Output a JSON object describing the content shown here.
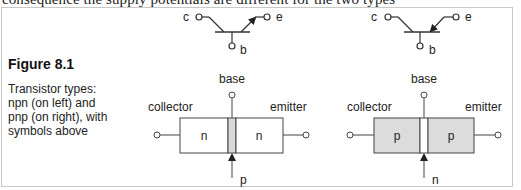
{
  "cutoff_text": "consequence the supply potentials are different for the two types",
  "figure": {
    "title": "Figure 8.1",
    "caption": "Transistor types: npn (on left) and pnp (on right), with symbols above"
  },
  "npn": {
    "symbol": {
      "collector_label": "c",
      "emitter_label": "e",
      "base_label": "b",
      "arrow_direction": "outward"
    },
    "block": {
      "base_label": "base",
      "collector_label": "collector",
      "emitter_label": "emitter",
      "left_region": "n",
      "right_region": "n",
      "middle_region": "p",
      "fill_color": "#ffffff",
      "strip_color": "#d9d9d9"
    }
  },
  "pnp": {
    "symbol": {
      "collector_label": "c",
      "emitter_label": "e",
      "base_label": "b",
      "arrow_direction": "inward"
    },
    "block": {
      "base_label": "base",
      "collector_label": "collector",
      "emitter_label": "emitter",
      "left_region": "p",
      "right_region": "p",
      "middle_region": "n",
      "fill_color": "#dcdcdc",
      "strip_color": "#ffffff"
    }
  }
}
